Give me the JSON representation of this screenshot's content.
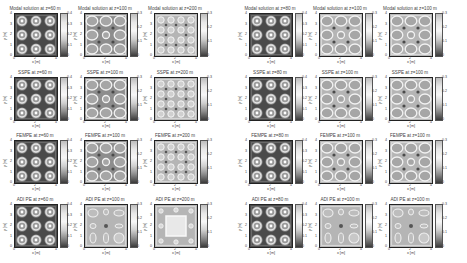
{
  "chart_data": {
    "type": "heatmap",
    "layout": {
      "rows": 4,
      "cols": 6,
      "groups": 2
    },
    "row_methods": [
      "Modal solution",
      "SSPE",
      "FEMPE",
      "ADI PE"
    ],
    "panels": [
      {
        "row": 0,
        "col": 0,
        "title": "Modal solution at z=60 m",
        "clim": [
          0,
          0.4
        ],
        "cticks": [
          "0",
          "0.1",
          "0.2",
          "0.3",
          "0.4"
        ],
        "pattern": "3x3",
        "tone": "dark"
      },
      {
        "row": 0,
        "col": 1,
        "title": "Modal solution at z=100 m",
        "clim": [
          0,
          0.3
        ],
        "cticks": [
          "0",
          "0.1",
          "0.2",
          "0.3"
        ],
        "pattern": "3x3-rings",
        "tone": "mid"
      },
      {
        "row": 0,
        "col": 2,
        "title": "Modal solution at z=200 m",
        "clim": [
          0,
          0.3
        ],
        "cticks": [
          "0",
          "0.1",
          "0.2",
          "0.3"
        ],
        "pattern": "4x4",
        "tone": "light"
      },
      {
        "row": 0,
        "col": 3,
        "title": "Modal solution at z=80 m",
        "clim": [
          0,
          0.4
        ],
        "cticks": [
          "0",
          "0.1",
          "0.2",
          "0.3",
          "0.4"
        ],
        "pattern": "3x3",
        "tone": "dark"
      },
      {
        "row": 0,
        "col": 4,
        "title": "Modal solution at z=100 m",
        "clim": [
          0,
          0.3
        ],
        "cticks": [
          "0",
          "0.1",
          "0.2",
          "0.3"
        ],
        "pattern": "3x3-rings",
        "tone": "light"
      },
      {
        "row": 0,
        "col": 5,
        "title": "Modal solution at z=100 m",
        "clim": [
          0,
          0.3
        ],
        "cticks": [
          "0",
          "0.1",
          "0.2",
          "0.3"
        ],
        "pattern": "3x3-rings",
        "tone": "light"
      },
      {
        "row": 1,
        "col": 0,
        "title": "SSPE at z=60 m",
        "clim": [
          0,
          0.4
        ],
        "cticks": [
          "0",
          "0.1",
          "0.2",
          "0.3",
          "0.4"
        ],
        "pattern": "3x3",
        "tone": "dark"
      },
      {
        "row": 1,
        "col": 1,
        "title": "SSPE at z=100 m",
        "clim": [
          0,
          0.3
        ],
        "cticks": [
          "0",
          "0.1",
          "0.2",
          "0.3"
        ],
        "pattern": "3x3-rings",
        "tone": "mid"
      },
      {
        "row": 1,
        "col": 2,
        "title": "SSPE at z=200 m",
        "clim": [
          0,
          0.3
        ],
        "cticks": [
          "0",
          "0.1",
          "0.2",
          "0.3"
        ],
        "pattern": "4x4",
        "tone": "light"
      },
      {
        "row": 1,
        "col": 3,
        "title": "SSPE at z=80 m",
        "clim": [
          0,
          0.4
        ],
        "cticks": [
          "0",
          "0.1",
          "0.2",
          "0.3",
          "0.4"
        ],
        "pattern": "3x3",
        "tone": "dark"
      },
      {
        "row": 1,
        "col": 4,
        "title": "SSPE at z=100 m",
        "clim": [
          0,
          0.3
        ],
        "cticks": [
          "0",
          "0.1",
          "0.2",
          "0.3"
        ],
        "pattern": "3x3-rings",
        "tone": "light"
      },
      {
        "row": 1,
        "col": 5,
        "title": "SSPE at z=100 m",
        "clim": [
          0,
          0.3
        ],
        "cticks": [
          "0",
          "0.1",
          "0.2",
          "0.3"
        ],
        "pattern": "3x3-rings",
        "tone": "light"
      },
      {
        "row": 2,
        "col": 0,
        "title": "FEMPE at z=60 m",
        "clim": [
          0,
          0.4
        ],
        "cticks": [
          "0",
          "0.1",
          "0.2",
          "0.3",
          "0.4"
        ],
        "pattern": "3x3",
        "tone": "dark"
      },
      {
        "row": 2,
        "col": 1,
        "title": "FEMPE at z=100 m",
        "clim": [
          0,
          0.3
        ],
        "cticks": [
          "0",
          "0.1",
          "0.2",
          "0.3"
        ],
        "pattern": "3x3-rings",
        "tone": "mid"
      },
      {
        "row": 2,
        "col": 2,
        "title": "FEMPE at z=200 m",
        "clim": [
          0,
          0.3
        ],
        "cticks": [
          "0",
          "0.1",
          "0.2",
          "0.3"
        ],
        "pattern": "4x4",
        "tone": "light"
      },
      {
        "row": 2,
        "col": 3,
        "title": "FEMPE at z=80 m",
        "clim": [
          0,
          0.4
        ],
        "cticks": [
          "0",
          "0.1",
          "0.2",
          "0.3",
          "0.4"
        ],
        "pattern": "3x3",
        "tone": "dark"
      },
      {
        "row": 2,
        "col": 4,
        "title": "FEMPE at z=100 m",
        "clim": [
          0,
          0.3
        ],
        "cticks": [
          "0",
          "0.1",
          "0.2",
          "0.3"
        ],
        "pattern": "3x3-rings",
        "tone": "light"
      },
      {
        "row": 2,
        "col": 5,
        "title": "FEMPE at z=100 m",
        "clim": [
          0,
          0.3
        ],
        "cticks": [
          "0",
          "0.1",
          "0.2",
          "0.3"
        ],
        "pattern": "3x3-rings",
        "tone": "light"
      },
      {
        "row": 3,
        "col": 0,
        "title": "ADI PE at z=60 m",
        "clim": [
          0,
          0.4
        ],
        "cticks": [
          "0",
          "0.1",
          "0.2",
          "0.3",
          "0.4"
        ],
        "pattern": "3x3",
        "tone": "dark"
      },
      {
        "row": 3,
        "col": 1,
        "title": "ADI PE at z=100 m",
        "clim": [
          0,
          0.3
        ],
        "cticks": [
          "0",
          "0.1",
          "0.2",
          "0.3"
        ],
        "pattern": "adi",
        "tone": "light"
      },
      {
        "row": 3,
        "col": 2,
        "title": "ADI PE at z=200 m",
        "clim": [
          0,
          0.3
        ],
        "cticks": [
          "0",
          "0.1",
          "0.2",
          "0.3"
        ],
        "pattern": "adi-square",
        "tone": "light"
      },
      {
        "row": 3,
        "col": 3,
        "title": "ADI PE at z=80 m",
        "clim": [
          0,
          0.4
        ],
        "cticks": [
          "0",
          "0.1",
          "0.2",
          "0.3",
          "0.4"
        ],
        "pattern": "3x3",
        "tone": "dark"
      },
      {
        "row": 3,
        "col": 4,
        "title": "ADI PE at z=100 m",
        "clim": [
          0,
          0.3
        ],
        "cticks": [
          "0",
          "0.1",
          "0.2",
          "0.3"
        ],
        "pattern": "adi",
        "tone": "light"
      },
      {
        "row": 3,
        "col": 5,
        "title": "ADI PE at z=100 m",
        "clim": [
          0,
          0.3
        ],
        "cticks": [
          "0",
          "0.1",
          "0.2",
          "0.3"
        ],
        "pattern": "adi",
        "tone": "light"
      }
    ],
    "xlabel": "x [m]",
    "ylabel": "y [m]",
    "xticks": [
      "0",
      "2",
      "4"
    ],
    "yticks": [
      "0",
      "1",
      "2",
      "3",
      "4"
    ],
    "xlim": [
      0,
      4
    ],
    "ylim": [
      0,
      4
    ],
    "colormap": "grayscale",
    "grid": false,
    "legend_position": "colorbar-right"
  }
}
